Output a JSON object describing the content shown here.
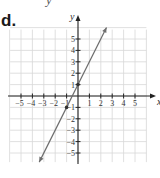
{
  "problem_label": "d.",
  "top_fragment": "y",
  "chart_data": {
    "type": "line",
    "title": "",
    "xlabel": "x",
    "ylabel": "y",
    "xlim": [
      -6,
      6
    ],
    "ylim": [
      -6,
      6
    ],
    "grid": true,
    "x_tick_labels": [
      "−5",
      "−4",
      "−3",
      "−2",
      "−1",
      "1",
      "2",
      "3",
      "4",
      "5"
    ],
    "y_tick_labels": [
      "5",
      "4",
      "3",
      "2",
      "1",
      "−1",
      "−2",
      "−3",
      "−4",
      "−5"
    ],
    "x_ticks": [
      -5,
      -4,
      -3,
      -2,
      -1,
      1,
      2,
      3,
      4,
      5
    ],
    "y_ticks": [
      5,
      4,
      3,
      2,
      1,
      -1,
      -2,
      -3,
      -4,
      -5
    ],
    "series": [
      {
        "name": "y = 2x + 1",
        "equation": "y = 2x + 1",
        "slope": 2,
        "intercept": 1,
        "x": [
          -3.4,
          -1,
          0,
          2.5
        ],
        "y": [
          -5.8,
          -1,
          1,
          6
        ],
        "marked_points": [
          [
            0,
            1
          ],
          [
            -1,
            -1
          ]
        ],
        "arrows_both_ends": true
      }
    ]
  },
  "colors": {
    "axis": "#222222",
    "grid": "#d8d8d8",
    "line": "#6e6e6e",
    "text": "#333333"
  }
}
